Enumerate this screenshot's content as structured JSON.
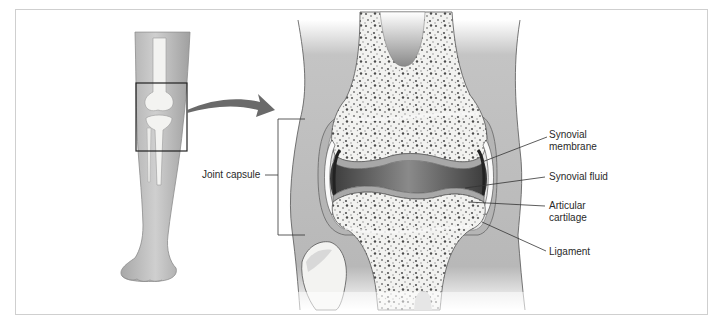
{
  "diagram": {
    "panels": [
      {
        "id": "leg-overview",
        "description": "Lower leg with knee highlighted by a square box"
      },
      {
        "id": "knee-cross-section",
        "description": "Enlarged cross-section of the knee joint"
      }
    ],
    "labels": {
      "joint_capsule": "Joint capsule",
      "synovial_membrane_line1": "Synovial",
      "synovial_membrane_line2": "membrane",
      "synovial_fluid": "Synovial fluid",
      "articular_cartilage_line1": "Articular",
      "articular_cartilage_line2": "cartilage",
      "ligament": "Ligament"
    },
    "colors": {
      "skin": "#bdbdbd",
      "skin_dark": "#9a9a9a",
      "bone": "#f4f4f2",
      "spongy_dots": "#6e6e6e",
      "cartilage": "#a9a9a9",
      "fluid": "#5a5a5a",
      "outline": "#444444",
      "arrow": "#6a6a6a",
      "frame_border": "#cfcfcf"
    }
  }
}
